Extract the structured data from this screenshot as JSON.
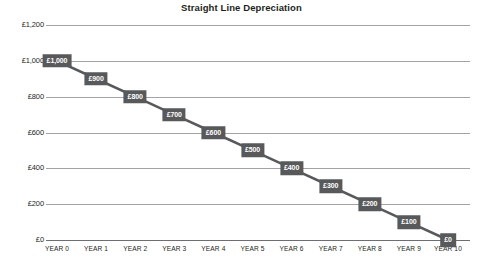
{
  "chart_data": {
    "type": "line",
    "title": "Straight Line Depreciation",
    "xlabel": "",
    "ylabel": "",
    "categories": [
      "YEAR 0",
      "YEAR 1",
      "YEAR 2",
      "YEAR 3",
      "YEAR 4",
      "YEAR 5",
      "YEAR 6",
      "YEAR 7",
      "YEAR 8",
      "YEAR 9",
      "YEAR 10"
    ],
    "values": [
      1000,
      900,
      800,
      700,
      600,
      500,
      400,
      300,
      200,
      100,
      0
    ],
    "point_labels": [
      "£1,000",
      "£900",
      "£800",
      "£700",
      "£600",
      "£500",
      "£400",
      "£300",
      "£200",
      "£100",
      "£0"
    ],
    "ylim": [
      0,
      1200
    ],
    "ytick_values": [
      0,
      200,
      400,
      600,
      800,
      1000,
      1200
    ],
    "ytick_labels": [
      "£0",
      "£200",
      "£400",
      "£600",
      "£800",
      "£1,000",
      "£1,200"
    ],
    "grid": true,
    "legend": false,
    "series_color": "#58595b",
    "label_box_color": "#58595b",
    "label_text_color": "#ffffff",
    "gridline_color": "#a3a3a5",
    "axis_color": "#6d6e71",
    "background_color": "#ffffff",
    "title_color": "#231f20",
    "tick_label_color": "#231f20"
  }
}
